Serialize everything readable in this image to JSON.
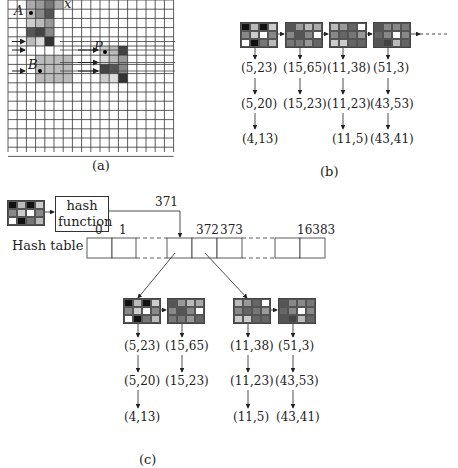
{
  "panel_a": {
    "caption": "(a)",
    "points": [
      {
        "label": "A",
        "desc": "point A in shaded region"
      },
      {
        "label": "B",
        "desc": "point B in shaded region"
      },
      {
        "label": "P",
        "desc": "query point P"
      },
      {
        "label": "x",
        "desc": "axis label at top"
      }
    ]
  },
  "panel_b": {
    "caption": "(b)",
    "chains": [
      {
        "entries": [
          "(5,23)",
          "(5,20)",
          "(4,13)"
        ]
      },
      {
        "entries": [
          "(15,65)",
          "(15,23)"
        ]
      },
      {
        "entries": [
          "(11,38)",
          "(11,23)",
          "(11,5)"
        ]
      },
      {
        "entries": [
          "(51,3)",
          "(43,53)",
          "(43,41)"
        ]
      }
    ]
  },
  "panel_c": {
    "caption": "(c)",
    "hash_function_line1": "hash",
    "hash_function_line2": "function",
    "hash_value": "371",
    "hash_table_label": "Hash table",
    "index_labels": [
      "0",
      "1",
      "372",
      "373",
      "16383"
    ],
    "chains_left": [
      {
        "entries": [
          "(5,23)",
          "(5,20)",
          "(4,13)"
        ]
      },
      {
        "entries": [
          "(15,65)",
          "(15,23)"
        ]
      }
    ],
    "chains_right": [
      {
        "entries": [
          "(11,38)",
          "(11,23)",
          "(11,5)"
        ]
      },
      {
        "entries": [
          "(51,3)",
          "(43,53)",
          "(43,41)"
        ]
      }
    ]
  },
  "patches": {
    "p1": [
      "#111",
      "#bbb",
      "#111",
      "#ccc",
      "#888",
      "#ccc",
      "#fff",
      "#888",
      "#fff",
      "#111",
      "#777",
      "#bbb"
    ],
    "p2": [
      "#555",
      "#999",
      "#bbb",
      "#aaa",
      "#888",
      "#555",
      "#888",
      "#fff",
      "#777",
      "#777",
      "#999",
      "#666"
    ],
    "p3": [
      "#bbb",
      "#999",
      "#666",
      "#fff",
      "#888",
      "#666",
      "#777",
      "#999",
      "#ccc",
      "#ccc",
      "#666",
      "#666"
    ],
    "p4": [
      "#555",
      "#888",
      "#888",
      "#777",
      "#666",
      "#888",
      "#fff",
      "#888",
      "#555",
      "#444",
      "#bbb",
      "#666"
    ]
  }
}
